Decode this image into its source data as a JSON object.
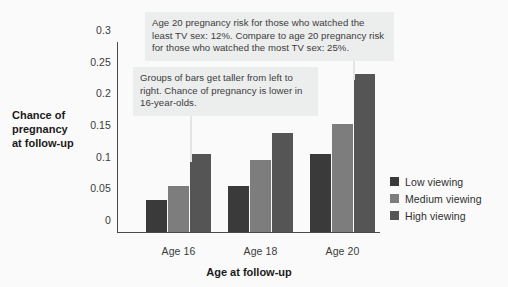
{
  "chart_data": {
    "type": "bar",
    "title": "",
    "xlabel": "Age at follow-up",
    "ylabel": "Chance of pregnancy at follow-up",
    "categories": [
      "Age 16",
      "Age 18",
      "Age 20"
    ],
    "series": [
      {
        "name": "Low viewing",
        "color": "#3a3a3a",
        "values": [
          0.051,
          0.073,
          0.123
        ]
      },
      {
        "name": "Medium viewing",
        "color": "#7d7d7d",
        "values": [
          0.073,
          0.113,
          0.17
        ]
      },
      {
        "name": "High viewing",
        "color": "#555555",
        "values": [
          0.123,
          0.157,
          0.25
        ]
      }
    ],
    "ylim": [
      0,
      0.3
    ],
    "ytick_labels": [
      "0",
      "0.05",
      "0.1",
      "0.15",
      "0.2",
      "0.25",
      "0.3"
    ],
    "ytick_values": [
      0,
      0.05,
      0.1,
      0.15,
      0.2,
      0.25,
      0.3
    ],
    "grid": false,
    "legend_position": "right"
  },
  "axis": {
    "y_title_lines": [
      "Chance of",
      "pregnancy",
      "at follow-up"
    ],
    "x_title": "Age at follow-up"
  },
  "annotations": [
    {
      "id": "callout-top",
      "text": "Age 20 pregnancy risk for those who watched the least TV sex: 12%. Compare to age 20 pregnancy risk for those who watched the most TV sex: 25%."
    },
    {
      "id": "callout-mid",
      "text": "Groups of bars get taller from left to right. Chance of pregnancy is lower in 16-year-olds."
    }
  ],
  "colors": {
    "background": "#fafafa",
    "callout_background": "#eceded",
    "axis": "#4a4a4a",
    "text": "#303030"
  }
}
